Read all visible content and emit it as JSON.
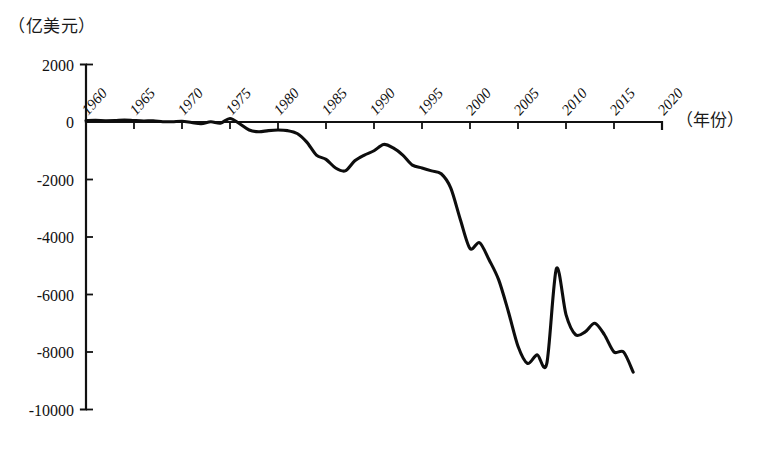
{
  "chart_data": {
    "type": "line",
    "title": "",
    "ylabel": "（亿美元）",
    "xlabel": "（年份）",
    "ylim": [
      -10000,
      2000
    ],
    "xlim": [
      1960,
      2020
    ],
    "grid": false,
    "legend": "none",
    "ytick_labels": [
      "2000",
      "0",
      "-2000",
      "-4000",
      "-6000",
      "-8000",
      "-10000"
    ],
    "ytick_values": [
      2000,
      0,
      -2000,
      -4000,
      -6000,
      -8000,
      -10000
    ],
    "xtick_labels": [
      "1960",
      "1965",
      "1970",
      "1975",
      "1980",
      "1985",
      "1990",
      "1995",
      "2000",
      "2005",
      "2010",
      "2015",
      "2020"
    ],
    "xtick_values": [
      1960,
      1965,
      1970,
      1975,
      1980,
      1985,
      1990,
      1995,
      2000,
      2005,
      2010,
      2015,
      2020
    ],
    "series": [
      {
        "name": "贸易差额",
        "color": "#0d0d0d",
        "x": [
          1960,
          1961,
          1962,
          1963,
          1964,
          1965,
          1966,
          1967,
          1968,
          1969,
          1970,
          1971,
          1972,
          1973,
          1974,
          1975,
          1976,
          1977,
          1978,
          1979,
          1980,
          1981,
          1982,
          1983,
          1984,
          1985,
          1986,
          1987,
          1988,
          1989,
          1990,
          1991,
          1992,
          1993,
          1994,
          1995,
          1996,
          1997,
          1998,
          1999,
          2000,
          2001,
          2002,
          2003,
          2004,
          2005,
          2006,
          2007,
          2008,
          2009,
          2010,
          2011,
          2012,
          2013,
          2014,
          2015,
          2016,
          2017
        ],
        "values": [
          50,
          55,
          45,
          50,
          70,
          50,
          35,
          40,
          10,
          10,
          25,
          -20,
          -60,
          10,
          -40,
          120,
          -60,
          -280,
          -340,
          -300,
          -280,
          -300,
          -400,
          -700,
          -1150,
          -1300,
          -1600,
          -1700,
          -1350,
          -1150,
          -1000,
          -780,
          -900,
          -1150,
          -1500,
          -1600,
          -1700,
          -1800,
          -2300,
          -3400,
          -4400,
          -4200,
          -4800,
          -5500,
          -6600,
          -7800,
          -8400,
          -8100,
          -8400,
          -5100,
          -6700,
          -7400,
          -7300,
          -7000,
          -7400,
          -8000,
          -8000,
          -8700
        ]
      }
    ]
  },
  "axes": {
    "y_axis_name": "value-axis",
    "x_axis_name": "year-axis"
  }
}
